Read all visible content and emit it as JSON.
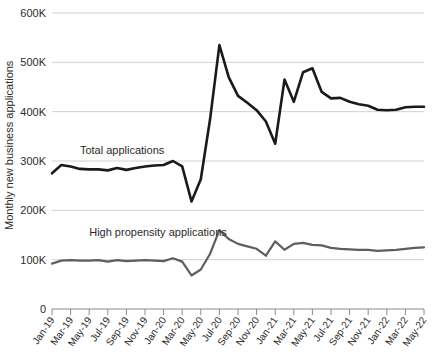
{
  "chart_data": {
    "type": "line",
    "title": "",
    "subtitle": "",
    "xlabel": "",
    "ylabel": "Monthly new business applications",
    "ylim": [
      0,
      600000
    ],
    "ytick_labels": [
      "0",
      "100K",
      "200K",
      "300K",
      "400K",
      "500K",
      "600K"
    ],
    "ytick_values": [
      0,
      100000,
      200000,
      300000,
      400000,
      500000,
      600000
    ],
    "grid": true,
    "legend_position": "inline-annotations",
    "x": [
      "Jan-19",
      "Feb-19",
      "Mar-19",
      "Apr-19",
      "May-19",
      "Jun-19",
      "Jul-19",
      "Aug-19",
      "Sep-19",
      "Oct-19",
      "Nov-19",
      "Dec-19",
      "Jan-20",
      "Feb-20",
      "Mar-20",
      "Apr-20",
      "May-20",
      "Jun-20",
      "Jul-20",
      "Aug-20",
      "Sep-20",
      "Oct-20",
      "Nov-20",
      "Dec-20",
      "Jan-21",
      "Feb-21",
      "Mar-21",
      "Apr-21",
      "May-21",
      "Jun-21",
      "Jul-21",
      "Aug-21",
      "Sep-21",
      "Oct-21",
      "Nov-21",
      "Dec-21",
      "Jan-22",
      "Feb-22",
      "Mar-22",
      "Apr-22",
      "May-22"
    ],
    "xtick_labels": [
      "Jan-19",
      "Mar-19",
      "May-19",
      "Jul-19",
      "Sep-19",
      "Nov-19",
      "Jan-20",
      "Mar-20",
      "May-20",
      "Jul-20",
      "Sep-20",
      "Nov-20",
      "Jan-21",
      "Mar-21",
      "May-21",
      "Jul-21",
      "Sep-21",
      "Nov-21",
      "Jan-22",
      "Mar-22",
      "May-22"
    ],
    "series": [
      {
        "name": "Total applications",
        "color": "#1a1a1a",
        "width": 2.6,
        "label_x_index": 3,
        "label_value": 315000,
        "values": [
          275000,
          292000,
          289000,
          284000,
          283000,
          283000,
          281000,
          286000,
          282000,
          286000,
          289000,
          291000,
          292000,
          300000,
          289000,
          218000,
          263000,
          385000,
          535000,
          470000,
          432000,
          418000,
          403000,
          380000,
          335000,
          465000,
          420000,
          480000,
          488000,
          440000,
          427000,
          428000,
          420000,
          415000,
          412000,
          404000,
          403000,
          404000,
          409000,
          410000,
          410000
        ],
        "annotations": [
          {
            "label": "Peak",
            "x": "Jul-20",
            "y": 535000
          },
          {
            "label": "Pandemic trough",
            "x": "Apr-20",
            "y": 218000
          }
        ]
      },
      {
        "name": "High propensity applications",
        "color": "#5e5e5e",
        "width": 2.2,
        "label_x_index": 4,
        "label_value": 148000,
        "values": [
          92000,
          98000,
          99000,
          98000,
          98000,
          99000,
          96000,
          99000,
          97000,
          98000,
          99000,
          98000,
          97000,
          103000,
          96000,
          68000,
          80000,
          112000,
          160000,
          142000,
          132000,
          127000,
          122000,
          108000,
          137000,
          120000,
          132000,
          134000,
          130000,
          129000,
          124000,
          122000,
          121000,
          120000,
          120000,
          118000,
          119000,
          120000,
          122000,
          124000,
          125000
        ]
      }
    ]
  },
  "axis": {
    "y_title": "Monthly new business applications",
    "y_labels": [
      "600K",
      "500K",
      "400K",
      "300K",
      "200K",
      "100K",
      "0"
    ]
  },
  "annotations": {
    "total_label": "Total applications",
    "high_propensity_label": "High propensity applications"
  }
}
